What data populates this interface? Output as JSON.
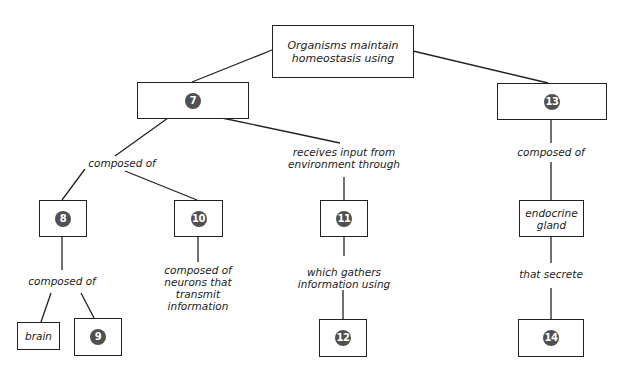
{
  "root": {
    "text_line1": "Organisms maintain",
    "text_line2": "homeostasis using"
  },
  "nodes": {
    "n7": "7",
    "n8": "8",
    "n9": "9",
    "n10": "10",
    "n11": "11",
    "n12": "12",
    "n13": "13",
    "n14": "14",
    "brain": "brain",
    "endocrine_line1": "endocrine",
    "endocrine_line2": "gland"
  },
  "links": {
    "composed_of_7": "composed of",
    "receives_line1": "receives input from",
    "receives_line2": "environment through",
    "composed_of_13": "composed of",
    "composed_of_8": "composed of",
    "neurons_line1": "composed of",
    "neurons_line2": "neurons that",
    "neurons_line3": "transmit",
    "neurons_line4": "information",
    "gathers_line1": "which gathers",
    "gathers_line2": "information using",
    "secrete": "that secrete"
  },
  "colors": {
    "number_badge": "#505050",
    "line": "#222222"
  }
}
